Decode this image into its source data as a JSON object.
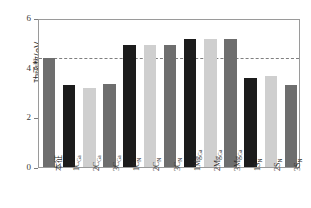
{
  "chart_data": {
    "type": "bar",
    "title": "",
    "subtitle": "",
    "xlabel": "",
    "ylabel": "功函数/eV",
    "ylim": [
      0,
      6
    ],
    "yticks": [
      0,
      2,
      4,
      6
    ],
    "ytick_labels": [
      "0",
      "2",
      "4",
      "6"
    ],
    "grid": false,
    "legend": "none",
    "categories": [
      "本征",
      "1C_Ga",
      "2C_Ga",
      "3C_Ga",
      "1C_N",
      "2C_N",
      "3C_N",
      "1Mg_Ga",
      "2Mg_Ga",
      "3Mg_Ga",
      "1S_N",
      "2S_N",
      "3S_N"
    ],
    "category_labels": [
      {
        "base": "本征",
        "sub": "",
        "cjk": true
      },
      {
        "base": "1C",
        "sub": "Ga",
        "cjk": false
      },
      {
        "base": "2C",
        "sub": "Ga",
        "cjk": false
      },
      {
        "base": "3C",
        "sub": "Ga",
        "cjk": false
      },
      {
        "base": "1C",
        "sub": "N",
        "cjk": false
      },
      {
        "base": "2C",
        "sub": "N",
        "cjk": false
      },
      {
        "base": "3C",
        "sub": "N",
        "cjk": false
      },
      {
        "base": "1Mg",
        "sub": "Ga",
        "cjk": false
      },
      {
        "base": "2Mg",
        "sub": "Ga",
        "cjk": false
      },
      {
        "base": "3Mg",
        "sub": "Ga",
        "cjk": false
      },
      {
        "base": "1S",
        "sub": "N",
        "cjk": false
      },
      {
        "base": "2S",
        "sub": "N",
        "cjk": false
      },
      {
        "base": "3S",
        "sub": "N",
        "cjk": false
      }
    ],
    "values": [
      4.4,
      3.3,
      3.2,
      3.35,
      4.9,
      4.9,
      4.93,
      5.15,
      5.15,
      5.17,
      3.6,
      3.68,
      3.3
    ],
    "bar_colors": [
      "#6e6e6e",
      "#1c1c1c",
      "#cfcfcf",
      "#6e6e6e",
      "#1c1c1c",
      "#cfcfcf",
      "#6e6e6e",
      "#1c1c1c",
      "#cfcfcf",
      "#6e6e6e",
      "#1c1c1c",
      "#cfcfcf",
      "#6e6e6e"
    ],
    "annotations": [
      {
        "type": "hline",
        "name": "intrinsic-work-function",
        "value": 4.45,
        "style": "dashed",
        "color": "#7f7f7f"
      }
    ]
  },
  "axis": {
    "frame_color": "#9a9a9a",
    "tick_color": "#7d7d7d"
  }
}
